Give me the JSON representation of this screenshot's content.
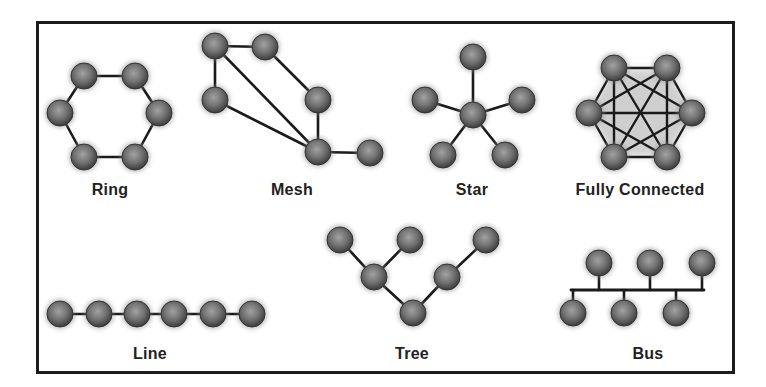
{
  "colors": {
    "frame": "#1c1c1c",
    "edge": "#1a1a1a",
    "node_light": "#9a9a9a",
    "node_mid": "#6e6e6e",
    "node_dark": "#3a3a3a",
    "label": "#222222"
  },
  "topologies": [
    {
      "name": "Ring",
      "label_pos": [
        110,
        181
      ],
      "nodes": [
        [
          84,
          76
        ],
        [
          135,
          76
        ],
        [
          159,
          113
        ],
        [
          135,
          157
        ],
        [
          84,
          157
        ],
        [
          60,
          113
        ]
      ],
      "edges": [
        [
          0,
          1
        ],
        [
          1,
          2
        ],
        [
          2,
          3
        ],
        [
          3,
          4
        ],
        [
          4,
          5
        ],
        [
          5,
          0
        ]
      ]
    },
    {
      "name": "Mesh",
      "label_pos": [
        292,
        181
      ],
      "nodes": [
        [
          215,
          46
        ],
        [
          265,
          47
        ],
        [
          215,
          100
        ],
        [
          318,
          100
        ],
        [
          318,
          152
        ],
        [
          370,
          153
        ]
      ],
      "edges": [
        [
          0,
          1
        ],
        [
          0,
          2
        ],
        [
          0,
          4
        ],
        [
          2,
          4
        ],
        [
          1,
          3
        ],
        [
          3,
          4
        ],
        [
          4,
          5
        ]
      ]
    },
    {
      "name": "Star",
      "label_pos": [
        472,
        181
      ],
      "nodes": [
        [
          473,
          115
        ],
        [
          473,
          57
        ],
        [
          425,
          100
        ],
        [
          522,
          100
        ],
        [
          443,
          155
        ],
        [
          505,
          155
        ]
      ],
      "edges": [
        [
          0,
          1
        ],
        [
          0,
          2
        ],
        [
          0,
          3
        ],
        [
          0,
          4
        ],
        [
          0,
          5
        ]
      ]
    },
    {
      "name": "Fully Connected",
      "label_pos": [
        640,
        181
      ],
      "nodes": [
        [
          614,
          68
        ],
        [
          667,
          68
        ],
        [
          692,
          113
        ],
        [
          667,
          157
        ],
        [
          614,
          157
        ],
        [
          589,
          113
        ]
      ],
      "edges": "all"
    },
    {
      "name": "Line",
      "label_pos": [
        150,
        345
      ],
      "nodes": [
        [
          60,
          314
        ],
        [
          99,
          314
        ],
        [
          137,
          314
        ],
        [
          174,
          314
        ],
        [
          213,
          314
        ],
        [
          252,
          314
        ]
      ],
      "edges": [
        [
          0,
          1
        ],
        [
          1,
          2
        ],
        [
          2,
          3
        ],
        [
          3,
          4
        ],
        [
          4,
          5
        ]
      ]
    },
    {
      "name": "Tree",
      "label_pos": [
        412,
        345
      ],
      "nodes": [
        [
          340,
          240
        ],
        [
          410,
          240
        ],
        [
          486,
          240
        ],
        [
          374,
          277
        ],
        [
          447,
          277
        ],
        [
          413,
          313
        ]
      ],
      "edges": [
        [
          0,
          3
        ],
        [
          1,
          3
        ],
        [
          3,
          5
        ],
        [
          2,
          4
        ],
        [
          4,
          5
        ]
      ]
    },
    {
      "name": "Bus",
      "label_pos": [
        648,
        345
      ],
      "nodes": [
        [
          599,
          263
        ],
        [
          650,
          263
        ],
        [
          702,
          263
        ],
        [
          573,
          313
        ],
        [
          624,
          313
        ],
        [
          676,
          313
        ]
      ],
      "bus": {
        "y": 290,
        "x1": 571,
        "x2": 704
      }
    }
  ]
}
